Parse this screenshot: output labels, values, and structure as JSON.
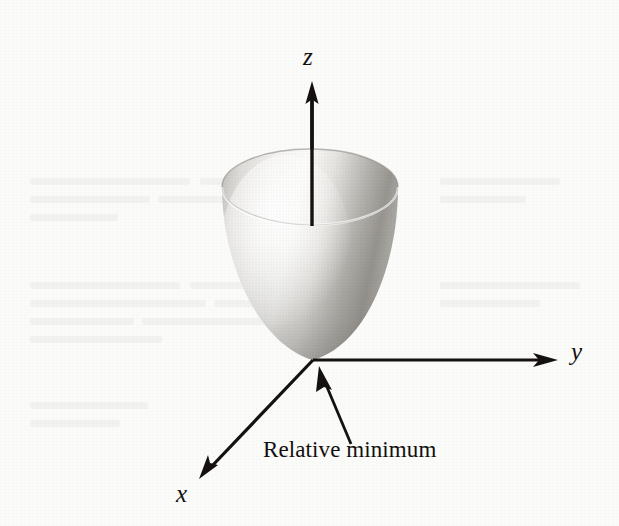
{
  "figure": {
    "kind": "3d-surface-illustration",
    "background_color": "#fbfbfa",
    "ink_color": "#14110f",
    "axes": [
      {
        "name": "z-axis",
        "label": "z",
        "direction": "up",
        "arrowhead": true,
        "label_style": "italic"
      },
      {
        "name": "y-axis",
        "label": "y",
        "direction": "right",
        "arrowhead": true,
        "label_style": "italic"
      },
      {
        "name": "x-axis",
        "label": "x",
        "direction": "down-left",
        "arrowhead": true,
        "label_style": "italic"
      }
    ],
    "annotation": {
      "text": "Relative minimum",
      "points_to": "origin",
      "leader_arrowhead": true
    },
    "surface": {
      "type": "paraboloid",
      "rim_shape": "ellipse",
      "interior_visible": true,
      "shading": "grayscale gradient, highlight upper-left, dark lower-right",
      "outer_light_tone": "#f2f1ef",
      "outer_dark_tone": "#8e8c88",
      "inner_light_tone": "#e8e7e4",
      "inner_dark_tone": "#6f6d69"
    }
  },
  "geometry": {
    "origin": {
      "x": 313,
      "y": 360
    },
    "z_axis": {
      "x": 312,
      "y_top": 83,
      "y_bottom": 360
    },
    "y_axis": {
      "y": 360,
      "x_start": 313,
      "x_end": 553
    },
    "x_axis": {
      "x_start": 313,
      "y_start": 360,
      "x_end": 200,
      "y_end": 478
    },
    "rim_ellipse": {
      "cx": 310,
      "cy": 187,
      "rx": 88,
      "ry": 38
    },
    "callout_arrow": {
      "x_tail": 350,
      "y_tail": 443,
      "x_tip": 320,
      "y_tip": 367
    }
  }
}
